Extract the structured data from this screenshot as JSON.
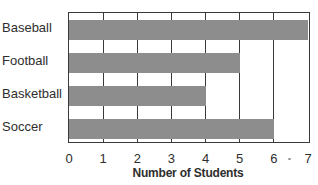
{
  "chart_data": {
    "type": "bar",
    "orientation": "horizontal",
    "title": "",
    "categories": [
      "Baseball",
      "Football",
      "Basketball",
      "Soccer"
    ],
    "values": [
      7,
      5,
      4,
      6
    ],
    "xlabel": "Number of Students",
    "ylabel": "",
    "xlim": [
      0,
      7
    ],
    "x_ticks": [
      "0",
      "1",
      "2",
      "3",
      "4",
      "5",
      "6",
      "7"
    ],
    "grid": true,
    "legend": null,
    "bar_color": "#8d8d8d"
  }
}
